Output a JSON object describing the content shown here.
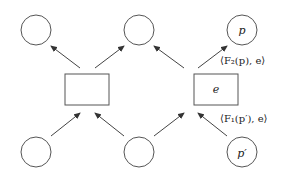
{
  "diagram": {
    "colors": {
      "stroke": "#555555",
      "text": "#222222"
    },
    "nodes": {
      "top_left": {
        "label": ""
      },
      "top_middle": {
        "label": ""
      },
      "top_right": {
        "label": "p"
      },
      "bottom_left": {
        "label": ""
      },
      "bottom_middle": {
        "label": ""
      },
      "bottom_right": {
        "label": "p′"
      },
      "box_left": {
        "label": ""
      },
      "box_right": {
        "label": "e"
      }
    },
    "edge_labels": {
      "top": "⟨F₂(p), e⟩",
      "bottom": "⟨F₁(p′), e⟩"
    }
  }
}
